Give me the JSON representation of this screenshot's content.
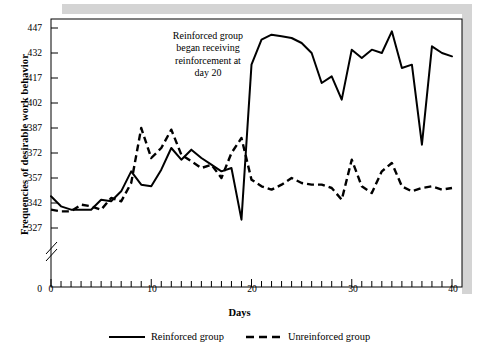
{
  "figure": {
    "annotation": "Reinforced group began receiving reinforcement at day 20",
    "annotation_lines": [
      "Reinforced group",
      "began receiving",
      "reinforcement at",
      "day 20"
    ],
    "band_color": "#d4d4d4",
    "line_color": "#000000"
  },
  "chart_data": {
    "type": "line",
    "title": "",
    "xlabel": "Days",
    "ylabel": "Frequencies of desirable work behavior",
    "xlim": [
      0,
      40
    ],
    "ylim": [
      327,
      447
    ],
    "y_axis_broken": true,
    "y_break_label": "0",
    "grid": false,
    "legend_position": "bottom-center",
    "xticks_major": [
      0,
      10,
      20,
      30,
      40
    ],
    "xtick_interval_minor": 1,
    "yticks": [
      327,
      342,
      357,
      372,
      387,
      402,
      417,
      432,
      447
    ],
    "x": [
      0,
      1,
      2,
      3,
      4,
      5,
      6,
      7,
      8,
      9,
      10,
      11,
      12,
      13,
      14,
      15,
      16,
      17,
      18,
      19,
      20,
      21,
      22,
      23,
      24,
      25,
      26,
      27,
      28,
      29,
      30,
      31,
      32,
      33,
      34,
      35,
      36,
      37,
      38,
      39,
      40
    ],
    "series": [
      {
        "name": "Reinforced group",
        "style": "solid",
        "values": [
          346,
          340,
          338,
          338,
          338,
          344,
          343,
          349,
          361,
          353,
          352,
          362,
          375,
          368,
          374,
          369,
          365,
          361,
          363,
          332,
          425,
          440,
          443,
          442,
          441,
          438,
          432,
          414,
          418,
          404,
          434,
          429,
          434,
          432,
          445,
          423,
          425,
          377,
          436,
          432,
          430
        ]
      },
      {
        "name": "Unreinforced group",
        "style": "dashed",
        "values": [
          338,
          337,
          337,
          341,
          340,
          338,
          345,
          343,
          354,
          387,
          369,
          375,
          386,
          371,
          367,
          363,
          365,
          357,
          372,
          381,
          356,
          352,
          350,
          353,
          357,
          354,
          353,
          353,
          351,
          344,
          368,
          352,
          348,
          361,
          366,
          352,
          349,
          351,
          352,
          350,
          351
        ]
      }
    ]
  },
  "axis_labels": {
    "y": [
      "447",
      "432",
      "417",
      "402",
      "387",
      "372",
      "357",
      "342",
      "327",
      "0"
    ],
    "x": [
      "0",
      "10",
      "20",
      "30",
      "40"
    ]
  },
  "legend": {
    "items": [
      {
        "label": "Reinforced group",
        "style": "solid"
      },
      {
        "label": "Unreinforced group",
        "style": "dashed"
      }
    ]
  }
}
